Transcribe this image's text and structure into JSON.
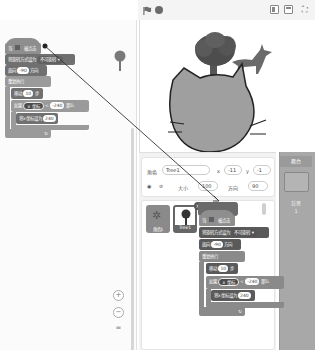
{
  "header": {
    "green_flag": "green-flag",
    "stop": "stop",
    "layout_small": "small-stage",
    "layout_normal": "normal-stage",
    "fullscreen_icon": "⛶"
  },
  "code_area": {
    "script": {
      "when_flag": {
        "prefix": "当",
        "suffix": "被点击"
      },
      "set_rotation": {
        "label": "将旋转方式设为",
        "value": "不可旋转 ▾"
      },
      "point_direction": {
        "prefix": "面向",
        "value": "-90",
        "suffix": "方向"
      },
      "forever": {
        "label": "重复执行"
      },
      "move": {
        "prefix": "移动",
        "value": "10",
        "suffix": "步"
      },
      "if_block": {
        "prefix": "如果",
        "reporter": "x 坐标",
        "op": "<",
        "value": "-240",
        "suffix": "那么"
      },
      "set_x": {
        "label": "将x坐标设为",
        "value": "240"
      },
      "forever_arrow": "↻"
    },
    "zoom_in": "+",
    "zoom_out": "−",
    "zoom_reset": "="
  },
  "dragged_script": {
    "when_flag": {
      "prefix": "当",
      "suffix": "被点击"
    },
    "set_rotation": {
      "label": "将旋转方式设为",
      "value": "不可旋转 ▾"
    },
    "point_direction": {
      "prefix": "面向",
      "value": "-90",
      "suffix": "方向"
    },
    "forever": {
      "label": "重复执行"
    },
    "move": {
      "prefix": "移动",
      "value": "10",
      "suffix": "步"
    },
    "if_block": {
      "prefix": "如果",
      "reporter": "x 坐标",
      "op": "<",
      "value": "-240",
      "suffix": "那么"
    },
    "set_x": {
      "label": "将x坐标设为",
      "value": "240"
    },
    "forever_arrow": "↻"
  },
  "sprite_info": {
    "sprite_label": "角色",
    "sprite_name": "Tree1",
    "x_label": "x",
    "x_value": "-11",
    "y_label": "y",
    "y_value": "-1",
    "show_label": "显示",
    "size_label": "大小",
    "size_value": "100",
    "direction_label": "方向",
    "direction_value": "90"
  },
  "sprite_list": {
    "items": [
      {
        "name": "角色1"
      },
      {
        "name": "Tree1",
        "selected": true
      }
    ],
    "delete_badge": "×"
  },
  "stage_target": {
    "title": "舞台",
    "backdrops_label": "背景",
    "backdrops_count": "1"
  }
}
